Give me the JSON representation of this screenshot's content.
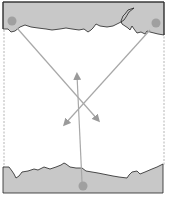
{
  "diagram": {
    "type": "force-diagram",
    "colors": {
      "background": "#ffffff",
      "gray_region": "#c8c8c8",
      "pin": "#a0a0a0",
      "line": "#a8a8a8",
      "outline": "#333333",
      "torn_edge": "#222222"
    },
    "frame": {
      "x": 3,
      "y": 2,
      "width": 161,
      "height": 191
    },
    "pins": [
      {
        "name": "top-left-pin",
        "cx": 12,
        "cy": 21,
        "r": 4.5
      },
      {
        "name": "top-right-pin",
        "cx": 156,
        "cy": 23,
        "r": 4.5
      },
      {
        "name": "bottom-pin",
        "cx": 83,
        "cy": 186,
        "r": 4.5
      }
    ],
    "strings": [
      {
        "name": "string-top-left",
        "from": [
          17,
          28
        ],
        "to": [
          99,
          121
        ],
        "arrow": true
      },
      {
        "name": "string-top-right",
        "from": [
          150,
          30
        ],
        "to": [
          64,
          125
        ],
        "arrow": true
      },
      {
        "name": "string-bottom",
        "from": [
          82,
          182
        ],
        "to": [
          77,
          74
        ],
        "arrow": true
      }
    ]
  }
}
